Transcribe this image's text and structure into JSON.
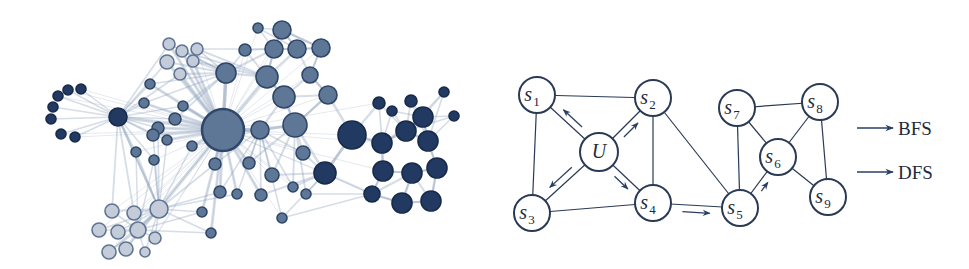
{
  "colors": {
    "dark_fill": "#223a62",
    "dark_stroke": "#172a4a",
    "medium_fill": "#5e7797",
    "medium_stroke": "#2f4668",
    "light_fill": "#c3ccd8",
    "light_stroke": "#5f7493",
    "edge": "#8a9db6",
    "graph_stroke": "#2a3a55",
    "arrow": "#2a3f62",
    "text": "#1e2a3a"
  },
  "network": {
    "nodes": [
      {
        "x": 68,
        "y": 90,
        "r": 5,
        "tone": "dark"
      },
      {
        "x": 81,
        "y": 89,
        "r": 5,
        "tone": "dark"
      },
      {
        "x": 58,
        "y": 96,
        "r": 5,
        "tone": "dark"
      },
      {
        "x": 53,
        "y": 107,
        "r": 5,
        "tone": "dark"
      },
      {
        "x": 51,
        "y": 119,
        "r": 5,
        "tone": "dark"
      },
      {
        "x": 61,
        "y": 134,
        "r": 5,
        "tone": "dark"
      },
      {
        "x": 75,
        "y": 137,
        "r": 5,
        "tone": "dark"
      },
      {
        "x": 118,
        "y": 117,
        "r": 9,
        "tone": "dark"
      },
      {
        "x": 169,
        "y": 44,
        "r": 6,
        "tone": "light"
      },
      {
        "x": 182,
        "y": 51,
        "r": 6,
        "tone": "light"
      },
      {
        "x": 197,
        "y": 49,
        "r": 6,
        "tone": "light"
      },
      {
        "x": 167,
        "y": 62,
        "r": 7,
        "tone": "light"
      },
      {
        "x": 193,
        "y": 61,
        "r": 6,
        "tone": "light"
      },
      {
        "x": 180,
        "y": 74,
        "r": 6,
        "tone": "light"
      },
      {
        "x": 150,
        "y": 84,
        "r": 5,
        "tone": "medium"
      },
      {
        "x": 144,
        "y": 103,
        "r": 5,
        "tone": "medium"
      },
      {
        "x": 183,
        "y": 106,
        "r": 5,
        "tone": "medium"
      },
      {
        "x": 175,
        "y": 119,
        "r": 6,
        "tone": "medium"
      },
      {
        "x": 158,
        "y": 128,
        "r": 6,
        "tone": "medium"
      },
      {
        "x": 153,
        "y": 135,
        "r": 6,
        "tone": "medium"
      },
      {
        "x": 167,
        "y": 140,
        "r": 5,
        "tone": "medium"
      },
      {
        "x": 136,
        "y": 152,
        "r": 5,
        "tone": "medium"
      },
      {
        "x": 154,
        "y": 160,
        "r": 5,
        "tone": "medium"
      },
      {
        "x": 192,
        "y": 146,
        "r": 5,
        "tone": "medium"
      },
      {
        "x": 223,
        "y": 130,
        "r": 21,
        "tone": "medium"
      },
      {
        "x": 258,
        "y": 28,
        "r": 5,
        "tone": "medium"
      },
      {
        "x": 282,
        "y": 30,
        "r": 9,
        "tone": "medium"
      },
      {
        "x": 245,
        "y": 50,
        "r": 6,
        "tone": "medium"
      },
      {
        "x": 274,
        "y": 49,
        "r": 9,
        "tone": "medium"
      },
      {
        "x": 297,
        "y": 49,
        "r": 9,
        "tone": "medium"
      },
      {
        "x": 321,
        "y": 48,
        "r": 9,
        "tone": "medium"
      },
      {
        "x": 226,
        "y": 73,
        "r": 10,
        "tone": "medium"
      },
      {
        "x": 267,
        "y": 77,
        "r": 11,
        "tone": "medium"
      },
      {
        "x": 310,
        "y": 75,
        "r": 8,
        "tone": "medium"
      },
      {
        "x": 284,
        "y": 97,
        "r": 11,
        "tone": "medium"
      },
      {
        "x": 328,
        "y": 95,
        "r": 9,
        "tone": "medium"
      },
      {
        "x": 260,
        "y": 130,
        "r": 9,
        "tone": "medium"
      },
      {
        "x": 295,
        "y": 125,
        "r": 12,
        "tone": "medium"
      },
      {
        "x": 352,
        "y": 135,
        "r": 14,
        "tone": "dark"
      },
      {
        "x": 325,
        "y": 173,
        "r": 11,
        "tone": "dark"
      },
      {
        "x": 379,
        "y": 103,
        "r": 6,
        "tone": "dark"
      },
      {
        "x": 392,
        "y": 111,
        "r": 5,
        "tone": "dark"
      },
      {
        "x": 411,
        "y": 101,
        "r": 6,
        "tone": "dark"
      },
      {
        "x": 444,
        "y": 92,
        "r": 5,
        "tone": "dark"
      },
      {
        "x": 423,
        "y": 117,
        "r": 10,
        "tone": "dark"
      },
      {
        "x": 454,
        "y": 116,
        "r": 5,
        "tone": "dark"
      },
      {
        "x": 406,
        "y": 131,
        "r": 10,
        "tone": "dark"
      },
      {
        "x": 382,
        "y": 143,
        "r": 10,
        "tone": "dark"
      },
      {
        "x": 428,
        "y": 141,
        "r": 10,
        "tone": "dark"
      },
      {
        "x": 437,
        "y": 168,
        "r": 10,
        "tone": "dark"
      },
      {
        "x": 383,
        "y": 171,
        "r": 10,
        "tone": "dark"
      },
      {
        "x": 412,
        "y": 173,
        "r": 10,
        "tone": "dark"
      },
      {
        "x": 372,
        "y": 194,
        "r": 8,
        "tone": "dark"
      },
      {
        "x": 402,
        "y": 203,
        "r": 10,
        "tone": "dark"
      },
      {
        "x": 431,
        "y": 201,
        "r": 10,
        "tone": "dark"
      },
      {
        "x": 215,
        "y": 164,
        "r": 6,
        "tone": "medium"
      },
      {
        "x": 249,
        "y": 163,
        "r": 6,
        "tone": "medium"
      },
      {
        "x": 303,
        "y": 153,
        "r": 7,
        "tone": "medium"
      },
      {
        "x": 272,
        "y": 175,
        "r": 7,
        "tone": "medium"
      },
      {
        "x": 220,
        "y": 192,
        "r": 6,
        "tone": "medium"
      },
      {
        "x": 237,
        "y": 194,
        "r": 5,
        "tone": "medium"
      },
      {
        "x": 261,
        "y": 195,
        "r": 6,
        "tone": "medium"
      },
      {
        "x": 293,
        "y": 187,
        "r": 5,
        "tone": "medium"
      },
      {
        "x": 306,
        "y": 194,
        "r": 5,
        "tone": "medium"
      },
      {
        "x": 282,
        "y": 218,
        "r": 5,
        "tone": "medium"
      },
      {
        "x": 202,
        "y": 212,
        "r": 5,
        "tone": "medium"
      },
      {
        "x": 211,
        "y": 233,
        "r": 5,
        "tone": "medium"
      },
      {
        "x": 159,
        "y": 209,
        "r": 9,
        "tone": "light"
      },
      {
        "x": 112,
        "y": 211,
        "r": 7,
        "tone": "light"
      },
      {
        "x": 134,
        "y": 213,
        "r": 7,
        "tone": "light"
      },
      {
        "x": 99,
        "y": 230,
        "r": 7,
        "tone": "light"
      },
      {
        "x": 118,
        "y": 232,
        "r": 7,
        "tone": "light"
      },
      {
        "x": 138,
        "y": 230,
        "r": 8,
        "tone": "light"
      },
      {
        "x": 155,
        "y": 238,
        "r": 6,
        "tone": "light"
      },
      {
        "x": 109,
        "y": 252,
        "r": 7,
        "tone": "light"
      },
      {
        "x": 126,
        "y": 249,
        "r": 7,
        "tone": "light"
      },
      {
        "x": 145,
        "y": 252,
        "r": 5,
        "tone": "light"
      }
    ]
  },
  "graph": {
    "nodes": [
      {
        "id": "s1",
        "base": "s",
        "sub": "1",
        "x": 537,
        "y": 95
      },
      {
        "id": "s2",
        "base": "s",
        "sub": "2",
        "x": 653,
        "y": 98
      },
      {
        "id": "U",
        "base": "U",
        "sub": "",
        "x": 599,
        "y": 152
      },
      {
        "id": "s3",
        "base": "s",
        "sub": "3",
        "x": 532,
        "y": 213
      },
      {
        "id": "s4",
        "base": "s",
        "sub": "4",
        "x": 653,
        "y": 203
      },
      {
        "id": "s5",
        "base": "s",
        "sub": "5",
        "x": 740,
        "y": 208
      },
      {
        "id": "s6",
        "base": "s",
        "sub": "6",
        "x": 778,
        "y": 157
      },
      {
        "id": "s7",
        "base": "s",
        "sub": "7",
        "x": 737,
        "y": 108
      },
      {
        "id": "s8",
        "base": "s",
        "sub": "8",
        "x": 820,
        "y": 102
      },
      {
        "id": "s9",
        "base": "s",
        "sub": "9",
        "x": 828,
        "y": 197
      }
    ],
    "node_radius": 18,
    "edges": [
      [
        "s1",
        "s2"
      ],
      [
        "s1",
        "U"
      ],
      [
        "s1",
        "s3"
      ],
      [
        "U",
        "s2"
      ],
      [
        "U",
        "s3"
      ],
      [
        "U",
        "s4"
      ],
      [
        "s2",
        "s4"
      ],
      [
        "s2",
        "s5"
      ],
      [
        "s3",
        "s4"
      ],
      [
        "s4",
        "s5"
      ],
      [
        "s5",
        "s7"
      ],
      [
        "s5",
        "s6"
      ],
      [
        "s7",
        "s6"
      ],
      [
        "s7",
        "s8"
      ],
      [
        "s8",
        "s6"
      ],
      [
        "s8",
        "s9"
      ],
      [
        "s6",
        "s9"
      ]
    ],
    "arrows": [
      {
        "from": "U",
        "to": "s1",
        "type": "bfs"
      },
      {
        "from": "U",
        "to": "s2",
        "type": "bfs"
      },
      {
        "from": "U",
        "to": "s3",
        "type": "bfs"
      },
      {
        "from": "U",
        "to": "s4",
        "type": "bfs"
      },
      {
        "from": "s4",
        "to": "s5",
        "type": "dfs"
      },
      {
        "from": "s5",
        "to": "s6",
        "type": "dfs"
      }
    ]
  },
  "legend": [
    {
      "label": "BFS",
      "type": "bfs"
    },
    {
      "label": "DFS",
      "type": "dfs"
    }
  ]
}
